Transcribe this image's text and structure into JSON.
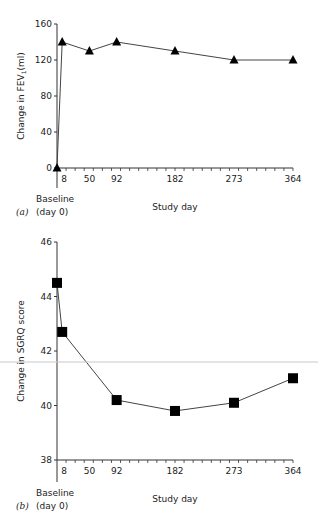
{
  "chart_data": [
    {
      "panel": "(a)",
      "type": "line",
      "marker": "triangle",
      "ylabel": "Change in FEV1 (ml)",
      "xlabel": "Study day",
      "baseline_label": [
        "Baseline",
        "(day 0)"
      ],
      "x": [
        0,
        8,
        50,
        92,
        182,
        273,
        364
      ],
      "values": [
        0,
        140,
        130,
        140,
        130,
        120,
        120
      ],
      "xticks": [
        8,
        50,
        92,
        182,
        273,
        364
      ],
      "yticks": [
        0,
        40,
        80,
        120,
        160
      ],
      "ylim": [
        0,
        160
      ],
      "xlim": [
        0,
        364
      ],
      "grid": false
    },
    {
      "panel": "(b)",
      "type": "line",
      "marker": "square",
      "ylabel": "Change in SGRQ score",
      "xlabel": "Study day",
      "baseline_label": [
        "Baseline",
        "(day 0)"
      ],
      "x": [
        0,
        8,
        92,
        182,
        273,
        364
      ],
      "values": [
        44.5,
        42.7,
        40.2,
        39.8,
        40.1,
        41.0
      ],
      "xticks": [
        8,
        50,
        92,
        182,
        273,
        364
      ],
      "yticks": [
        38,
        40,
        42,
        44,
        46
      ],
      "ylim": [
        38,
        46
      ],
      "xlim": [
        0,
        364
      ],
      "grid": false
    }
  ],
  "labels": {
    "a": {
      "panel": "(a)",
      "ylabel_main": "Change in FEV",
      "ylabel_sub": "1",
      "ylabel_unit": "(ml)",
      "xlabel": "Study day",
      "baseline": "Baseline",
      "day0": "(day 0)"
    },
    "b": {
      "panel": "(b)",
      "ylabel": "Change in SGRQ score",
      "xlabel": "Study day",
      "baseline": "Baseline",
      "day0": "(day 0)"
    }
  }
}
